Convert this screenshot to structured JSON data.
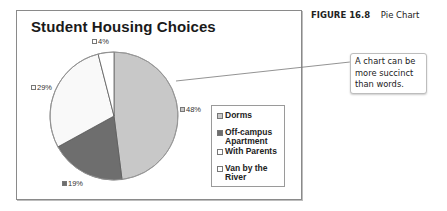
{
  "figure": {
    "number_label": "FIGURE 16.8",
    "caption": "Pie Chart"
  },
  "callout": {
    "text": "A chart can be more succinct than words."
  },
  "colors": {
    "dorms": "#c8c8c8",
    "off_campus": "#6e6e6e",
    "with_parents": "#f9f9f9",
    "van": "#ffffff",
    "slice_border": "#5a5a5a"
  },
  "chart_data": {
    "type": "pie",
    "title": "Student Housing Choices",
    "categories": [
      "Dorms",
      "Off-campus Apartment",
      "With Parents",
      "Van by the River"
    ],
    "values": [
      48,
      19,
      29,
      4
    ],
    "unit": "%",
    "data_labels": [
      "48%",
      "19%",
      "29%",
      "4%"
    ],
    "legend_position": "right",
    "start_angle": "12 o'clock, clockwise"
  },
  "legend": {
    "items": [
      {
        "label": "Dorms"
      },
      {
        "label": "Off-campus Apartment"
      },
      {
        "label": "With Parents"
      },
      {
        "label": "Van by the River"
      }
    ]
  }
}
